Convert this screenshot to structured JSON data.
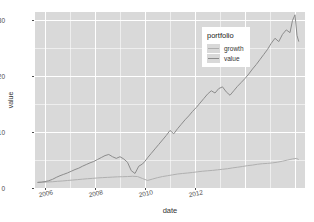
{
  "chart_data": {
    "type": "line",
    "title": "",
    "xlabel": "date",
    "ylabel": "value",
    "grid": true,
    "legend_position": "inside-top-right",
    "legend_title": "portfolio",
    "xlim": [
      2005.6,
      2016.4
    ],
    "ylim": [
      0,
      31.5
    ],
    "y_ticks": [
      0,
      10,
      20,
      30
    ],
    "y_tick_labels": [
      "0",
      "10",
      "20",
      "30"
    ],
    "x_ticks": [
      2006,
      2008,
      2010,
      2012
    ],
    "x_tick_labels": [
      "2006",
      "2008",
      "2010",
      "2012"
    ],
    "series": [
      {
        "name": "growth",
        "color": "#b0b0b0",
        "x": [
          2005.7,
          2005.9,
          2006.1,
          2006.3,
          2006.5,
          2006.7,
          2006.9,
          2007.1,
          2007.3,
          2007.5,
          2007.7,
          2007.9,
          2008.1,
          2008.3,
          2008.5,
          2008.7,
          2008.9,
          2009.1,
          2009.3,
          2009.5,
          2009.7,
          2009.9,
          2010.1,
          2010.3,
          2010.5,
          2010.7,
          2010.9,
          2011.1,
          2011.3,
          2011.5,
          2011.7,
          2011.9,
          2012.1,
          2012.3,
          2012.5,
          2012.7,
          2012.9,
          2013.1,
          2013.3,
          2013.5,
          2013.7,
          2013.9,
          2014.1,
          2014.3,
          2014.5,
          2014.7,
          2014.9,
          2015.1,
          2015.3,
          2015.5,
          2015.7,
          2015.9,
          2016.05,
          2016.15
        ],
        "y": [
          1.0,
          1.02,
          1.08,
          1.12,
          1.2,
          1.26,
          1.34,
          1.42,
          1.5,
          1.58,
          1.66,
          1.72,
          1.8,
          1.86,
          1.9,
          1.95,
          2.0,
          2.02,
          2.05,
          2.1,
          2.05,
          1.7,
          1.35,
          1.6,
          1.85,
          2.05,
          2.2,
          2.35,
          2.5,
          2.6,
          2.68,
          2.78,
          2.9,
          3.0,
          3.08,
          3.15,
          3.25,
          3.35,
          3.45,
          3.6,
          3.72,
          3.85,
          4.0,
          4.1,
          4.25,
          4.35,
          4.4,
          4.5,
          4.62,
          4.8,
          5.0,
          5.2,
          5.3,
          5.1
        ]
      },
      {
        "name": "value",
        "color": "#8c8c8c",
        "x": [
          2005.7,
          2005.85,
          2006.0,
          2006.15,
          2006.3,
          2006.45,
          2006.6,
          2006.75,
          2006.9,
          2007.05,
          2007.2,
          2007.35,
          2007.5,
          2007.65,
          2007.8,
          2007.95,
          2008.1,
          2008.25,
          2008.4,
          2008.55,
          2008.7,
          2008.85,
          2009.0,
          2009.15,
          2009.3,
          2009.45,
          2009.6,
          2009.75,
          2009.9,
          2010.0,
          2010.1,
          2010.25,
          2010.4,
          2010.55,
          2010.7,
          2010.85,
          2011.0,
          2011.15,
          2011.3,
          2011.45,
          2011.6,
          2011.75,
          2011.9,
          2012.05,
          2012.2,
          2012.35,
          2012.5,
          2012.65,
          2012.8,
          2012.95,
          2013.1,
          2013.25,
          2013.4,
          2013.55,
          2013.7,
          2013.85,
          2014.0,
          2014.15,
          2014.3,
          2014.45,
          2014.6,
          2014.75,
          2014.9,
          2015.05,
          2015.2,
          2015.35,
          2015.5,
          2015.65,
          2015.8,
          2015.9,
          2016.0,
          2016.08,
          2016.15
        ],
        "y": [
          1.0,
          1.05,
          1.15,
          1.3,
          1.55,
          1.9,
          2.2,
          2.45,
          2.7,
          3.0,
          3.3,
          3.55,
          3.9,
          4.2,
          4.5,
          4.75,
          5.1,
          5.45,
          5.8,
          6.0,
          5.6,
          5.3,
          5.6,
          5.2,
          4.6,
          3.1,
          2.6,
          3.9,
          4.3,
          4.8,
          5.4,
          6.2,
          7.0,
          7.8,
          8.6,
          9.4,
          10.3,
          9.7,
          10.6,
          11.4,
          12.2,
          12.9,
          13.7,
          14.4,
          15.2,
          16.0,
          16.8,
          17.4,
          17.0,
          17.8,
          18.1,
          17.2,
          16.6,
          17.4,
          18.2,
          18.9,
          19.6,
          20.4,
          21.3,
          22.1,
          23.0,
          23.9,
          24.8,
          25.9,
          26.8,
          26.2,
          27.5,
          28.3,
          27.8,
          30.0,
          31.0,
          27.3,
          26.2
        ]
      }
    ],
    "panel_background": "#d9d9d9",
    "gridline_color": "#ffffff"
  }
}
